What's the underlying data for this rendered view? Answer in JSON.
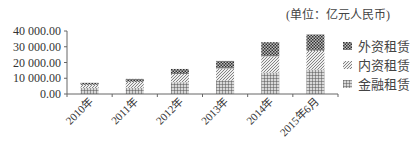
{
  "unit_label": "(单位：亿元人民币)",
  "legend": [
    {
      "name": "外资租赁",
      "pattern": "dots-dark"
    },
    {
      "name": "内资租赁",
      "pattern": "diagonal"
    },
    {
      "name": "金融租赁",
      "pattern": "grid"
    }
  ],
  "chart_data": {
    "type": "bar",
    "stacked": true,
    "title": "",
    "unit": "(单位：亿元人民币)",
    "xlabel": "",
    "ylabel": "",
    "categories": [
      "2010年",
      "2011年",
      "2012年",
      "2013年",
      "2014年",
      "2015年6月"
    ],
    "series": [
      {
        "name": "金融租赁",
        "values": [
          3800,
          3900,
          7500,
          8700,
          13600,
          15500
        ]
      },
      {
        "name": "内资租赁",
        "values": [
          2100,
          3900,
          5200,
          7600,
          10400,
          12000
        ]
      },
      {
        "name": "外资租赁",
        "values": [
          1200,
          1800,
          3200,
          4700,
          8900,
          10300
        ]
      }
    ],
    "totals": [
      7100,
      9600,
      15900,
      21000,
      32900,
      37800
    ],
    "ylim": [
      0,
      40000
    ],
    "yticks": [
      "0.00",
      "10 000.00",
      "20 000.00",
      "30 000.00",
      "40 000.00"
    ],
    "grid": false,
    "legend_position": "right"
  }
}
